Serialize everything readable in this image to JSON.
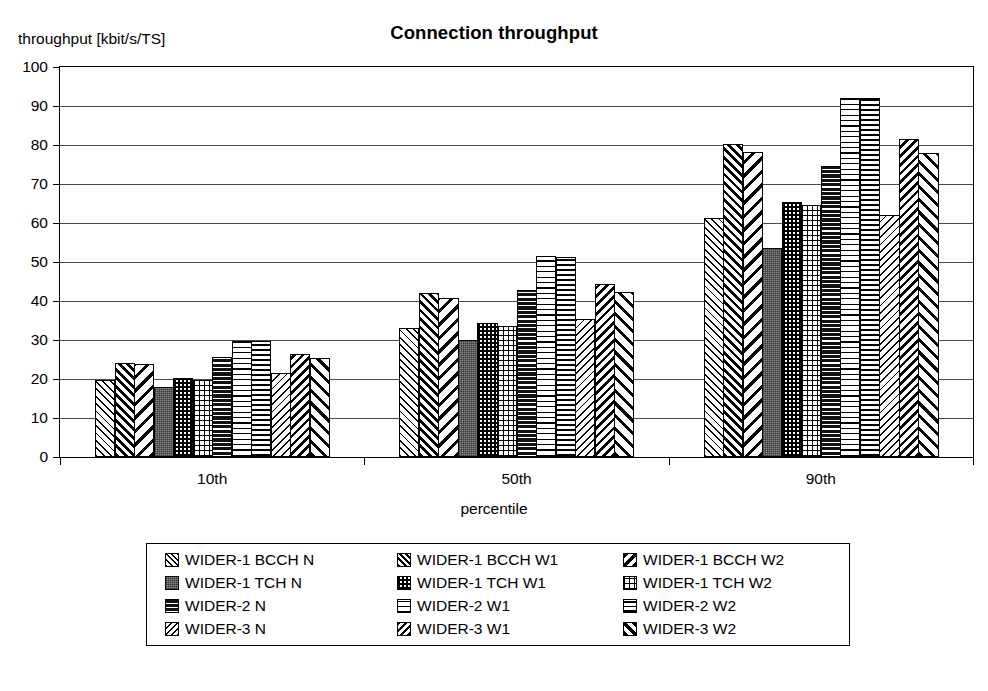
{
  "chart_data": {
    "type": "bar",
    "title": "Connection throughput",
    "ylabel": "throughput [kbit/s/TS]",
    "xlabel": "percentile",
    "categories": [
      "10th",
      "50th",
      "90th"
    ],
    "ylim": [
      0,
      100
    ],
    "yticks": [
      0,
      10,
      20,
      30,
      40,
      50,
      60,
      70,
      80,
      90,
      100
    ],
    "grid": true,
    "legend_position": "bottom",
    "series": [
      {
        "name": "WIDER-1 BCCH N",
        "pattern": "p-fwd-thin",
        "values": [
          19.8,
          33.2,
          61.3
        ]
      },
      {
        "name": "WIDER-1 BCCH W1",
        "pattern": "p-fwd-heavy",
        "values": [
          24.2,
          42.0,
          80.2
        ]
      },
      {
        "name": "WIDER-1 BCCH W2",
        "pattern": "p-bwd-bold",
        "values": [
          23.8,
          40.8,
          78.2
        ]
      },
      {
        "name": "WIDER-1 TCH N",
        "pattern": "p-gray50",
        "values": [
          18.0,
          30.0,
          53.7
        ]
      },
      {
        "name": "WIDER-1 TCH W1",
        "pattern": "p-checker",
        "values": [
          20.3,
          34.3,
          65.5
        ]
      },
      {
        "name": "WIDER-1 TCH W2",
        "pattern": "p-grid-fine",
        "values": [
          19.7,
          33.6,
          64.5
        ]
      },
      {
        "name": "WIDER-2 N",
        "pattern": "p-horiz-dark",
        "values": [
          25.6,
          42.8,
          74.5
        ]
      },
      {
        "name": "WIDER-2 W1",
        "pattern": "p-horiz-light",
        "values": [
          29.7,
          51.5,
          92.0
        ]
      },
      {
        "name": "WIDER-2 W2",
        "pattern": "p-horiz-med",
        "values": [
          29.7,
          51.2,
          92.0
        ]
      },
      {
        "name": "WIDER-3 N",
        "pattern": "p-bwd-thin",
        "values": [
          21.6,
          35.4,
          62.0
        ]
      },
      {
        "name": "WIDER-3 W1",
        "pattern": "p-bwd-heavy",
        "values": [
          26.3,
          44.4,
          81.5
        ]
      },
      {
        "name": "WIDER-3 W2",
        "pattern": "p-fwd-bold",
        "values": [
          25.4,
          42.4,
          78.0
        ]
      }
    ]
  },
  "legend": {
    "columns": [
      [
        "WIDER-1 BCCH N",
        "WIDER-1 TCH N",
        "WIDER-2 N",
        "WIDER-3 N"
      ],
      [
        "WIDER-1 BCCH W1",
        "WIDER-1 TCH W1",
        "WIDER-2 W1",
        "WIDER-3 W1"
      ],
      [
        "WIDER-1 BCCH W2",
        "WIDER-1 TCH W2",
        "WIDER-2 W2",
        "WIDER-3 W2"
      ]
    ]
  },
  "colors": {
    "axis": "#000000",
    "gridline": "#4a4a4a",
    "background": "#ffffff",
    "text": "#000000"
  }
}
